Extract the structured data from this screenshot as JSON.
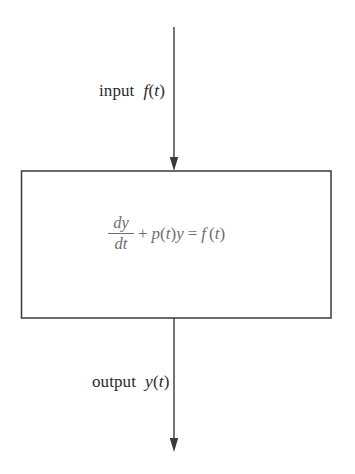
{
  "diagram": {
    "background_color": "#ffffff",
    "line_color": "#3a3a3a",
    "label_color": "#2b2b2b",
    "equation_color": "#6e6e6e",
    "input": {
      "label_word": "input",
      "label_math_fn": "f",
      "label_math_open": "(",
      "label_math_var": "t",
      "label_math_close": ")",
      "arrow_name": "input-arrow"
    },
    "output": {
      "label_word": "output",
      "label_math_fn": "y",
      "label_math_open": "(",
      "label_math_var": "t",
      "label_math_close": ")",
      "arrow_name": "output-arrow"
    },
    "box": {
      "name": "system-box",
      "equation_plain": "dy/dt + p(t)y = f(t)",
      "fraction_numerator": "dy",
      "fraction_denominator": "dt",
      "operator_plus": "+",
      "coefficient_fn": "p",
      "coefficient_open": "(",
      "coefficient_var": "t",
      "coefficient_close": ")",
      "dependent_var": "y",
      "operator_equals": "=",
      "forcing_fn": "f",
      "forcing_open": "(",
      "forcing_var": "t",
      "forcing_close": ")"
    }
  }
}
